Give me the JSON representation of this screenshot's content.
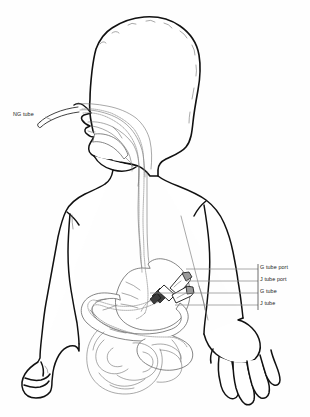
{
  "figure": {
    "background_color": "#fefefe",
    "outline_color": "#111111",
    "organ_color": "#5e5e5e",
    "leader_color": "#8d8d8d",
    "tube_color": "#8a8a8a"
  },
  "labels": {
    "ng": {
      "text": "NG tube",
      "position": "left",
      "x": 13,
      "y": 112
    },
    "callouts": [
      {
        "text": "G tube port",
        "y": 267,
        "leader_y": 269
      },
      {
        "text": "J tube port",
        "y": 279,
        "leader_y": 281
      },
      {
        "text": "G tube",
        "y": 291,
        "leader_y": 293
      },
      {
        "text": "J tube",
        "y": 303,
        "leader_y": 305
      }
    ]
  },
  "anatomy": {
    "parts": [
      "head",
      "nasal-cavity",
      "oral-cavity",
      "tongue",
      "pharynx",
      "neck",
      "torso",
      "left-arm",
      "right-arm",
      "left-hand",
      "right-hand",
      "esophagus",
      "stomach",
      "duodenum",
      "jejunum",
      "small-intestine",
      "large-intestine"
    ],
    "devices": [
      "ng-tube",
      "gj-tube-connector",
      "g-tube-port",
      "j-tube-port",
      "g-tube-lumen",
      "j-tube-lumen"
    ]
  }
}
